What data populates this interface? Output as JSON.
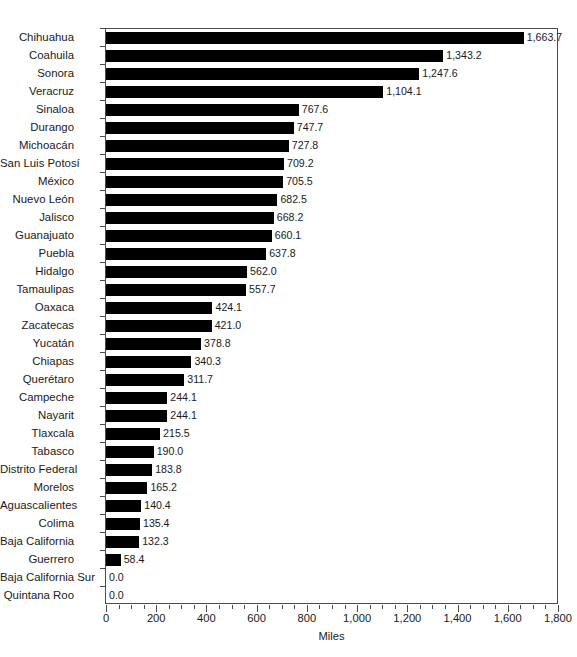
{
  "chart_data": {
    "type": "bar",
    "orientation": "horizontal",
    "title": "",
    "xlabel": "Miles",
    "ylabel": "",
    "xlim": [
      0,
      1800
    ],
    "xticks": [
      "0",
      "200",
      "400",
      "600",
      "800",
      "1,000",
      "1,200",
      "1,400",
      "1,600",
      "1,800"
    ],
    "xtick_values": [
      0,
      200,
      400,
      600,
      800,
      1000,
      1200,
      1400,
      1600,
      1800
    ],
    "minor_tick_step": 50,
    "grid": false,
    "legend": false,
    "bar_color": "#000000",
    "categories": [
      "Chihuahua",
      "Coahuila",
      "Sonora",
      "Veracruz",
      "Sinaloa",
      "Durango",
      "Michoacán",
      "San Luis Potosí",
      "México",
      "Nuevo León",
      "Jalisco",
      "Guanajuato",
      "Puebla",
      "Hidalgo",
      "Tamaulipas",
      "Oaxaca",
      "Zacatecas",
      "Yucatán",
      "Chiapas",
      "Querétaro",
      "Campeche",
      "Nayarit",
      "Tlaxcala",
      "Tabasco",
      "Distrito Federal",
      "Morelos",
      "Aguascalientes",
      "Colima",
      "Baja California",
      "Guerrero",
      "Baja California Sur",
      "Quintana Roo"
    ],
    "values": [
      1663.7,
      1343.2,
      1247.6,
      1104.1,
      767.6,
      747.7,
      727.8,
      709.2,
      705.5,
      682.5,
      668.2,
      660.1,
      637.8,
      562.0,
      557.7,
      424.1,
      421.0,
      378.8,
      340.3,
      311.7,
      244.1,
      244.1,
      215.5,
      190.0,
      183.8,
      165.2,
      140.4,
      135.4,
      132.3,
      58.4,
      0.0,
      0.0
    ],
    "value_labels": [
      "1,663.7",
      "1,343.2",
      "1,247.6",
      "1,104.1",
      "767.6",
      "747.7",
      "727.8",
      "709.2",
      "705.5",
      "682.5",
      "668.2",
      "660.1",
      "637.8",
      "562.0",
      "557.7",
      "424.1",
      "421.0",
      "378.8",
      "340.3",
      "311.7",
      "244.1",
      "244.1",
      "215.5",
      "190.0",
      "183.8",
      "165.2",
      "140.4",
      "135.4",
      "132.3",
      "58.4",
      "0.0",
      "0.0"
    ]
  },
  "footer": {
    "source_note": ""
  }
}
